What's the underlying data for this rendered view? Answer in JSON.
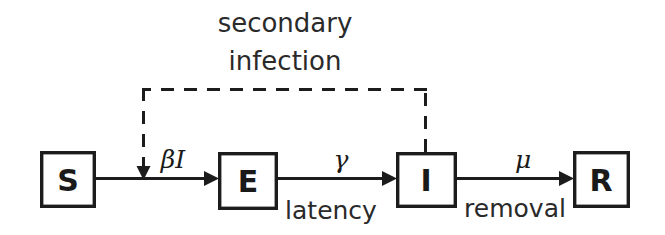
{
  "diagram": {
    "type": "compartmental-flow",
    "background_color": "#ffffff",
    "stroke_color": "#1c1c1c",
    "text_color": "#2a2a2a",
    "compartments": [
      {
        "id": "S",
        "label": "S",
        "name": "susceptible",
        "x": 40,
        "y": 151,
        "w": 56,
        "h": 57
      },
      {
        "id": "E",
        "label": "E",
        "name": "exposed",
        "x": 218,
        "y": 152,
        "w": 60,
        "h": 58
      },
      {
        "id": "I",
        "label": "I",
        "name": "infectious",
        "x": 396,
        "y": 152,
        "w": 61,
        "h": 56
      },
      {
        "id": "R",
        "label": "R",
        "name": "removed",
        "x": 573,
        "y": 151,
        "w": 57,
        "h": 57
      }
    ],
    "transitions": [
      {
        "id": "s-to-e",
        "from": "S",
        "to": "E",
        "rate_label": "βI",
        "process_label": ""
      },
      {
        "id": "e-to-i",
        "from": "E",
        "to": "I",
        "rate_label": "γ",
        "process_label": "latency"
      },
      {
        "id": "i-to-r",
        "from": "I",
        "to": "R",
        "rate_label": "μ",
        "process_label": "removal"
      }
    ],
    "feedback": {
      "id": "secondary-infection",
      "from": "I",
      "to": "s-to-e",
      "style": "dashed",
      "label_line1": "secondary",
      "label_line2": "infection"
    }
  }
}
